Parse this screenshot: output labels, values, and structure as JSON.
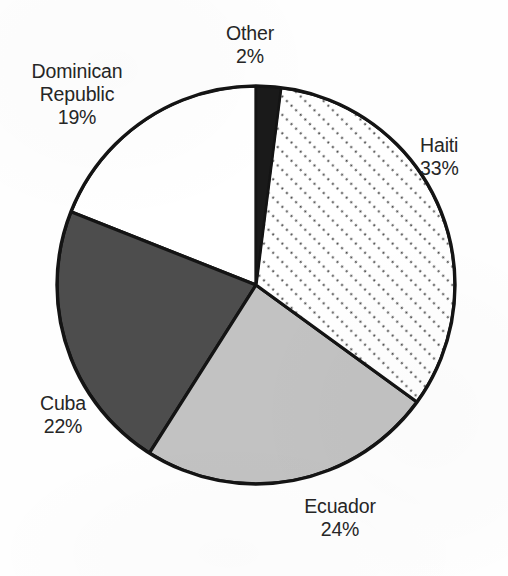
{
  "chart_data": {
    "type": "pie",
    "title": "",
    "subtitle": "",
    "xlabel": "",
    "ylabel": "",
    "legend_position": "none",
    "labels_position": "outside-callout",
    "grid": false,
    "units": "percent",
    "total": 100,
    "start_angle_deg": -90,
    "direction": "clockwise",
    "categories": [
      "Other",
      "Haiti",
      "Ecuador",
      "Cuba",
      "Dominican Republic"
    ],
    "values": [
      2,
      33,
      24,
      22,
      19
    ],
    "slices": [
      {
        "name": "Other",
        "value": 2,
        "value_label": "2%",
        "fill": "#1a1a1a",
        "fill_style": "solid-black",
        "start_angle_deg": -90,
        "sweep_angle_deg": 7.2
      },
      {
        "name": "Haiti",
        "value": 33,
        "value_label": "33%",
        "fill": "#ffffff",
        "fill_style": "dotted-diagonal-hatch",
        "hatch_color": "#4a4a4a",
        "start_angle_deg": -82.8,
        "sweep_angle_deg": 118.8
      },
      {
        "name": "Ecuador",
        "value": 24,
        "value_label": "24%",
        "fill": "#c2c2c2",
        "fill_style": "solid-light-gray",
        "start_angle_deg": 36.0,
        "sweep_angle_deg": 86.4
      },
      {
        "name": "Cuba",
        "value": 22,
        "value_label": "22%",
        "fill": "#4d4d4d",
        "fill_style": "solid-dark-gray",
        "start_angle_deg": 122.4,
        "sweep_angle_deg": 79.2
      },
      {
        "name": "Dominican Republic",
        "value": 19,
        "value_label": "19%",
        "fill": "#ffffff",
        "fill_style": "solid-white",
        "start_angle_deg": 201.6,
        "sweep_angle_deg": 68.4
      }
    ],
    "geometry": {
      "center_x": 256,
      "center_y": 285,
      "radius": 199,
      "outline_color": "#141414",
      "outline_width": 3.2
    }
  },
  "labels": {
    "other": {
      "name": "Other",
      "pct": "2%"
    },
    "dominican_republic": {
      "name_line1": "Dominican",
      "name_line2": "Republic",
      "pct": "19%"
    },
    "haiti": {
      "name": "Haiti",
      "pct": "33%"
    },
    "cuba": {
      "name": "Cuba",
      "pct": "22%"
    },
    "ecuador": {
      "name": "Ecuador",
      "pct": "24%"
    }
  },
  "colors": {
    "background": "#ffffff",
    "outline": "#141414",
    "text": "#262626",
    "other_fill": "#1a1a1a",
    "cuba_fill": "#4d4d4d",
    "ecuador_fill": "#c2c2c2",
    "haiti_fill": "#ffffff",
    "dominican_republic_fill": "#ffffff"
  }
}
